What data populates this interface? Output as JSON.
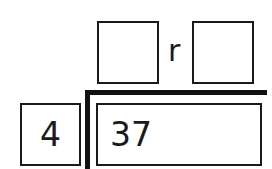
{
  "diagram": {
    "type": "long-division-template",
    "quotient": {
      "value": "",
      "placeholder": ""
    },
    "remainder_label": "r",
    "remainder": {
      "value": "",
      "placeholder": ""
    },
    "divisor": "4",
    "dividend": "37"
  },
  "colors": {
    "ink": "#1a1a1a",
    "bracket": "#111111",
    "background": "#ffffff"
  }
}
